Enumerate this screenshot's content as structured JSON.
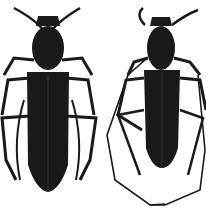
{
  "image": {
    "description": "Two black longhorn beetles (Cerambycidae), dorsal view, on white background",
    "background_color": "#ffffff",
    "body_color": "#1a1a1a",
    "specimens": [
      {
        "label": "female",
        "position": "left",
        "antennae": "short, upward"
      },
      {
        "label": "male",
        "position": "right",
        "antennae": "long, looping below body"
      }
    ]
  }
}
